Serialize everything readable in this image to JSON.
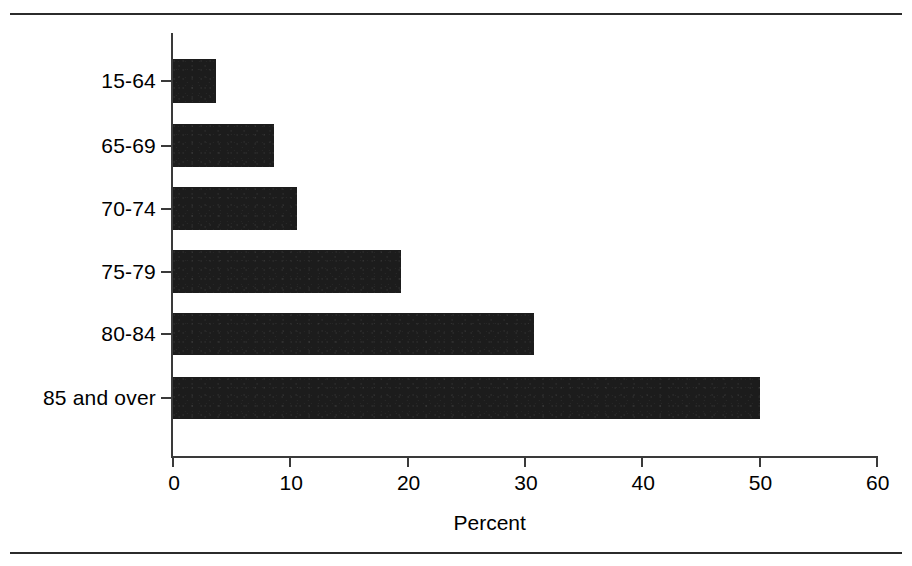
{
  "figure": {
    "background_color": "#ffffff",
    "bar_color": "#1c1c1c",
    "axis_color": "#3a3a3a",
    "rule_color": "#2b2b2b",
    "has_top_rule": true,
    "has_bottom_rule": true
  },
  "chart_data": {
    "type": "bar",
    "orientation": "horizontal",
    "title": "",
    "subtitle": "",
    "categories": [
      "15-64",
      "65-69",
      "70-74",
      "75-79",
      "80-84",
      "85 and over"
    ],
    "values": [
      3.7,
      8.6,
      10.6,
      19.4,
      30.8,
      50.0
    ],
    "series": [
      {
        "name": "Percent",
        "values": [
          3.7,
          8.6,
          10.6,
          19.4,
          30.8,
          50.0
        ]
      }
    ],
    "xlabel": "Percent",
    "ylabel": "",
    "xlim": [
      0,
      60
    ],
    "xticks": [
      0,
      10,
      20,
      30,
      40,
      50,
      60
    ],
    "xtick_labels": [
      "0",
      "10",
      "20",
      "30",
      "40",
      "50",
      "60"
    ],
    "ytick_labels": [
      "15-64",
      "65-69",
      "70-74",
      "75-79",
      "80-84",
      "85 and over"
    ],
    "grid": false,
    "legend": false,
    "legend_position": "none",
    "annotations": []
  }
}
